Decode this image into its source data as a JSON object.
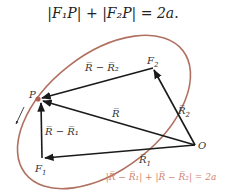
{
  "equation": {
    "text": "|F₁P| + |F₂P| = 2a."
  },
  "labels": {
    "P": "P",
    "F1": "F",
    "F1_sub": "1",
    "F2": "F",
    "F2_sub": "2",
    "O": "O",
    "R": "R̅",
    "R1": "R̅",
    "R1_sub": "1",
    "R2": "R̅",
    "R2_sub": "2",
    "R_minus_R1": "R̅ − R̅₁",
    "R_minus_R2": "R̅ − R̅₂"
  },
  "caption": "|R̅ − R̅₁| + |R̅ − R̅₂| = 2a",
  "colors": {
    "ellipse": "#b07060",
    "vectors": "#1a1a1a",
    "caption": "#d4826c",
    "point": "#b06050"
  }
}
